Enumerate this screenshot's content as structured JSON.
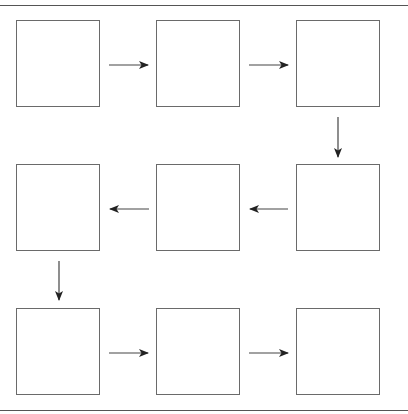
{
  "diagram": {
    "type": "snake-flow",
    "rows": 3,
    "cols": 3,
    "colors": {
      "stroke": "#6a6a6a",
      "arrow": "#222222",
      "rule": "#555555",
      "background": "#ffffff"
    },
    "boxes": [
      {
        "id": "r1c1",
        "row": 1,
        "col": 1,
        "x": 16,
        "y": 20,
        "label": ""
      },
      {
        "id": "r1c2",
        "row": 1,
        "col": 2,
        "x": 156,
        "y": 20,
        "label": ""
      },
      {
        "id": "r1c3",
        "row": 1,
        "col": 3,
        "x": 296,
        "y": 20,
        "label": ""
      },
      {
        "id": "r2c3",
        "row": 2,
        "col": 3,
        "x": 296,
        "y": 164,
        "label": ""
      },
      {
        "id": "r2c2",
        "row": 2,
        "col": 2,
        "x": 156,
        "y": 164,
        "label": ""
      },
      {
        "id": "r2c1",
        "row": 2,
        "col": 1,
        "x": 16,
        "y": 164,
        "label": ""
      },
      {
        "id": "r3c1",
        "row": 3,
        "col": 1,
        "x": 16,
        "y": 308,
        "label": ""
      },
      {
        "id": "r3c2",
        "row": 3,
        "col": 2,
        "x": 156,
        "y": 308,
        "label": ""
      },
      {
        "id": "r3c3",
        "row": 3,
        "col": 3,
        "x": 296,
        "y": 308,
        "label": ""
      }
    ],
    "arrows": [
      {
        "from": "r1c1",
        "to": "r1c2",
        "direction": "right"
      },
      {
        "from": "r1c2",
        "to": "r1c3",
        "direction": "right"
      },
      {
        "from": "r1c3",
        "to": "r2c3",
        "direction": "down"
      },
      {
        "from": "r2c3",
        "to": "r2c2",
        "direction": "left"
      },
      {
        "from": "r2c2",
        "to": "r2c1",
        "direction": "left"
      },
      {
        "from": "r2c1",
        "to": "r3c1",
        "direction": "down"
      },
      {
        "from": "r3c1",
        "to": "r3c2",
        "direction": "right"
      },
      {
        "from": "r3c2",
        "to": "r3c3",
        "direction": "right"
      }
    ]
  }
}
